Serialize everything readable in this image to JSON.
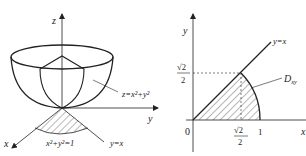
{
  "figures": [
    {
      "name": "paraboloid-3d",
      "axes": {
        "x": "x",
        "y": "y",
        "z": "z"
      },
      "surface_label": "z=x²+y²",
      "circle_label": "x²+y²=1",
      "line_label": "y=x"
    },
    {
      "name": "region-2d",
      "axes": {
        "x": "x",
        "y": "y"
      },
      "origin_label": "0",
      "line_label": "y=x",
      "region_label": "D",
      "region_sub": "xy",
      "tick_sqrt2_over_2_num": "√2",
      "tick_sqrt2_over_2_den": "2",
      "tick_one": "1",
      "ytick_num": "√2",
      "ytick_den": "2"
    }
  ],
  "colors": {
    "stroke": "#222222",
    "background": "#ffffff"
  }
}
